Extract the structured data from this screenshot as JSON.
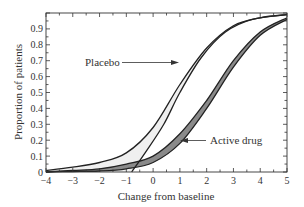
{
  "chart_data": {
    "type": "line",
    "title": "",
    "xlabel": "Change from baseline",
    "ylabel": "Proportion of patients",
    "xlim": [
      -4,
      5
    ],
    "ylim": [
      0,
      1
    ],
    "x_ticks": [
      "-4",
      "-3",
      "-2",
      "-1",
      "0",
      "1",
      "2",
      "3",
      "4",
      "5"
    ],
    "y_ticks": [
      "0",
      "0.1",
      "0.2",
      "0.3",
      "0.4",
      "0.5",
      "0.6",
      "0.7",
      "0.8",
      "0.9"
    ],
    "grid": false,
    "annotations": [
      {
        "text": "Placebo",
        "arrow_to": [
          0.4,
          0.68
        ]
      },
      {
        "text": "Active drug",
        "arrow_to": [
          1.2,
          0.2
        ]
      }
    ],
    "series": [
      {
        "name": "Placebo (bound 1)",
        "group": "Placebo",
        "x": [
          -4,
          -3,
          -2,
          -1,
          0,
          1,
          2,
          3,
          4,
          5
        ],
        "y": [
          0.01,
          0.03,
          0.06,
          0.12,
          0.28,
          0.55,
          0.78,
          0.92,
          0.97,
          0.99
        ]
      },
      {
        "name": "Placebo (bound 2)",
        "group": "Placebo",
        "x": [
          -0.8,
          -0.3,
          0.4,
          1.0,
          1.8,
          2.7,
          3.7,
          5
        ],
        "y": [
          0,
          0.12,
          0.3,
          0.5,
          0.72,
          0.88,
          0.96,
          0.99
        ]
      },
      {
        "name": "Active drug (bound 1)",
        "group": "Active drug",
        "x": [
          -4,
          -3,
          -2,
          -1,
          0,
          1,
          2,
          3,
          4,
          5
        ],
        "y": [
          0.0,
          0.01,
          0.02,
          0.05,
          0.1,
          0.24,
          0.45,
          0.7,
          0.88,
          0.97
        ]
      },
      {
        "name": "Active drug (bound 2)",
        "group": "Active drug",
        "x": [
          -4,
          -3,
          -2,
          -1,
          0,
          1,
          2,
          3,
          4,
          5
        ],
        "y": [
          0.0,
          0.003,
          0.006,
          0.02,
          0.06,
          0.18,
          0.4,
          0.66,
          0.86,
          0.96
        ]
      }
    ],
    "fills": {
      "placebo": "#efefef",
      "active": "#8a8a8a"
    }
  },
  "labels": {
    "placebo": "Placebo",
    "active": "Active drug",
    "xlabel": "Change from baseline",
    "ylabel": "Proportion of patients"
  }
}
